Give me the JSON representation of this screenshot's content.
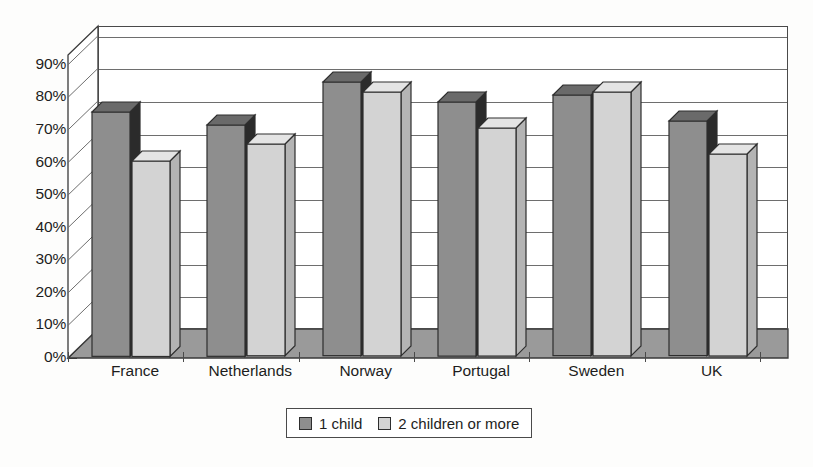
{
  "chart_data": {
    "type": "bar",
    "title": "",
    "subtitle": "",
    "xlabel": "",
    "ylabel": "",
    "categories": [
      "France",
      "Netherlands",
      "Norway",
      "Portugal",
      "Sweden",
      "UK"
    ],
    "series": [
      {
        "name": "1 child",
        "color": "#8e8e8e",
        "values": [
          75,
          71,
          84,
          78,
          80,
          72
        ]
      },
      {
        "name": "2 children or more",
        "color": "#d3d3d3",
        "values": [
          60,
          65,
          81,
          70,
          81,
          62
        ]
      }
    ],
    "ylim": [
      0,
      90
    ],
    "ytick_values": [
      0,
      10,
      20,
      30,
      40,
      50,
      60,
      70,
      80,
      90
    ],
    "ytick_labels": [
      "0%",
      "10%",
      "20%",
      "30%",
      "40%",
      "50%",
      "60%",
      "70%",
      "80%",
      "90%"
    ],
    "grid": true,
    "grid_axis": "y",
    "legend_position": "bottom-center",
    "three_d": true,
    "value_suffix": "%"
  },
  "legend": {
    "entries": [
      {
        "label": "1 child",
        "swatch": "dark"
      },
      {
        "label": "2 children or more",
        "swatch": "light"
      }
    ]
  },
  "colors": {
    "series_1_child": "#8e8e8e",
    "series_2_children": "#d3d3d3",
    "bar_outline": "#2e2e2e",
    "gridline": "#6e6e6e",
    "floor": "#9a9a9a",
    "background": "#fdfdfc"
  }
}
